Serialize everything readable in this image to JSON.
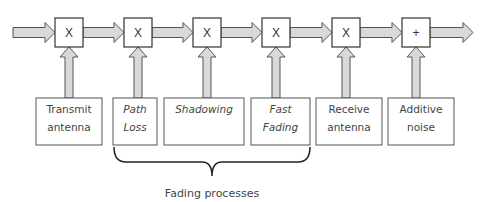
{
  "diagram": {
    "operators": [
      {
        "symbol": "X",
        "input": "Transmit antenna"
      },
      {
        "symbol": "X",
        "input": "Path Loss"
      },
      {
        "symbol": "X",
        "input": "Shadowing"
      },
      {
        "symbol": "X",
        "input": "Fast Fading"
      },
      {
        "symbol": "X",
        "input": "Receive antenna"
      },
      {
        "symbol": "+",
        "input": "Additive noise"
      }
    ],
    "blocks": [
      {
        "lines": [
          "Transmit",
          "antenna"
        ],
        "italic": false
      },
      {
        "lines": [
          "Path",
          "Loss"
        ],
        "italic": true
      },
      {
        "lines": [
          "Shadowing"
        ],
        "italic": true
      },
      {
        "lines": [
          "Fast",
          "Fading"
        ],
        "italic": true
      },
      {
        "lines": [
          "Receive",
          "antenna"
        ],
        "italic": false
      },
      {
        "lines": [
          "Additive",
          "noise"
        ],
        "italic": false
      }
    ],
    "brace_label": "Fading processes",
    "colors": {
      "arrow_fill": "#d9d9d9",
      "stroke": "#555555",
      "text": "#444444"
    }
  }
}
